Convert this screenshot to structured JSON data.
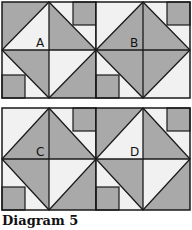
{
  "caption": "Diagram 5",
  "colors": {
    "dark": "#a9a9a9",
    "light": "#f1f1f1",
    "line": "#1a1a1a",
    "label": "#111111"
  },
  "blocks": [
    {
      "label": "A",
      "x": 2,
      "y": 2,
      "w": 94,
      "h": 96,
      "diamond": {
        "top_left": "light",
        "top_right": "dark",
        "bottom_left": "dark",
        "bottom_right": "light"
      },
      "corners": {
        "top_left": "dark",
        "top_right": "light",
        "bottom_left": "light",
        "bottom_right": "dark"
      },
      "small_squares": [
        "top_right",
        "bottom_left"
      ]
    },
    {
      "label": "B",
      "x": 96,
      "y": 2,
      "w": 94,
      "h": 96,
      "diamond": {
        "top_left": "dark",
        "top_right": "dark",
        "bottom_left": "dark",
        "bottom_right": "dark"
      },
      "corners": {
        "top_left": "light",
        "top_right": "light",
        "bottom_left": "light",
        "bottom_right": "light"
      },
      "small_squares": [
        "top_right",
        "bottom_left"
      ]
    },
    {
      "label": "C",
      "x": 2,
      "y": 108,
      "w": 94,
      "h": 102,
      "diamond": {
        "top_left": "dark",
        "top_right": "dark",
        "bottom_left": "dark",
        "bottom_right": "light"
      },
      "corners": {
        "top_left": "light",
        "top_right": "light",
        "bottom_left": "light",
        "bottom_right": "dark"
      },
      "small_squares": [
        "top_right",
        "bottom_left"
      ]
    },
    {
      "label": "D",
      "x": 96,
      "y": 108,
      "w": 94,
      "h": 102,
      "diamond": {
        "top_left": "light",
        "top_right": "dark",
        "bottom_left": "dark",
        "bottom_right": "light"
      },
      "corners": {
        "top_left": "dark",
        "top_right": "light",
        "bottom_left": "light",
        "bottom_right": "dark"
      },
      "small_squares": [
        "top_right",
        "bottom_left"
      ]
    }
  ]
}
